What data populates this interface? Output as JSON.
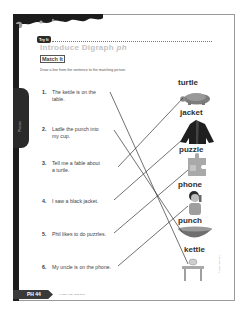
{
  "header": {
    "tag": "Try It",
    "title_main": "Introduce Digraph ",
    "title_em": "ph",
    "subtitle": "Match It",
    "instruction": "Draw a line from the sentence to the matching picture."
  },
  "side_tab": {
    "label": "Phonics"
  },
  "sentences": [
    {
      "num": "1.",
      "line1": "The kettle is on the",
      "line2": "table."
    },
    {
      "num": "2.",
      "line1": "Ladle the punch into",
      "line2": "my cup."
    },
    {
      "num": "3.",
      "line1": "Tell me a fable about",
      "line2": "a turtle."
    },
    {
      "num": "4.",
      "line1": "I saw a black jacket.",
      "line2": ""
    },
    {
      "num": "5.",
      "line1": "Phil likes to do puzzles.",
      "line2": ""
    },
    {
      "num": "6.",
      "line1": "My uncle is on the phone.",
      "line2": ""
    }
  ],
  "pictures": [
    {
      "word": "turtle",
      "icon": "turtle-icon"
    },
    {
      "word": "jacket",
      "icon": "jacket-icon"
    },
    {
      "word": "puzzle",
      "icon": "puzzle-icon"
    },
    {
      "word": "phone",
      "icon": "phone-icon"
    },
    {
      "word": "punch",
      "icon": "punch-bowl-icon"
    },
    {
      "word": "kettle",
      "icon": "kettle-icon"
    }
  ],
  "matches": [
    {
      "sentence": 1,
      "picture": "kettle"
    },
    {
      "sentence": 2,
      "picture": "punch"
    },
    {
      "sentence": 3,
      "picture": "turtle"
    },
    {
      "sentence": 4,
      "picture": "jacket"
    },
    {
      "sentence": 5,
      "picture": "puzzle"
    },
    {
      "sentence": 6,
      "picture": "phone"
    }
  ],
  "footer": {
    "page_label": "PH 44",
    "note": "LANGUAGE ARTS GRK",
    "copyright": "© Evan-Moor Corp."
  }
}
